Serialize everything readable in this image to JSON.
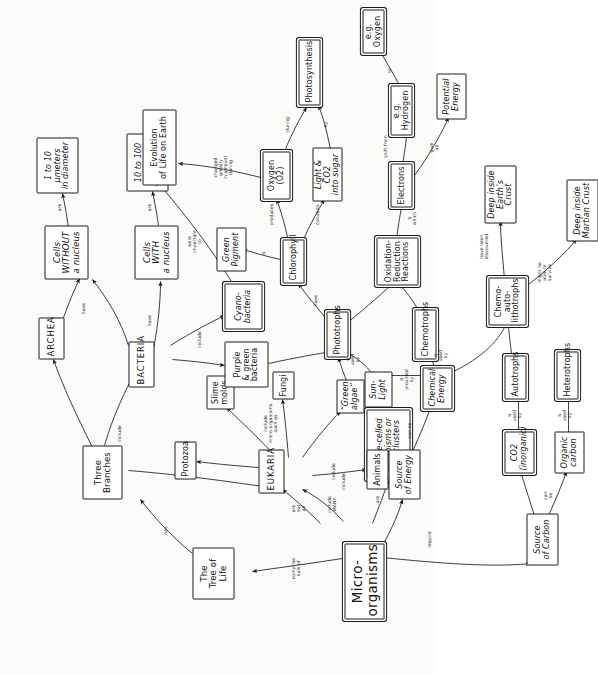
{
  "diagram": {
    "title": "Micro-organisms",
    "kind": "concept-map",
    "orientation": "rotated-90-ccw",
    "ink_color": "#1a1a1a",
    "paper_color": "#fbfbfa"
  },
  "nodes": {
    "micro_organisms": "Micro-organisms",
    "tree_of_life": "The\nTree of\nLife",
    "three_branches": "Three\nBranches",
    "archea": "ARCHEA",
    "bacteria": "BACTERIA",
    "eukaria": "EUKARIA",
    "cells_without_nucleus": "Cells\nWITHOUT\na nucleus",
    "cells_with_nucleus": "Cells\nWITH\na nucleus",
    "size_1_10": "1 to 10\nµmeters\nin diameter",
    "size_10_100": "10 to 100\nµmeters\nin diameter",
    "single_celled": "Single-celled\norganisms or\ncell clusters",
    "protozoa": "Protozoa",
    "slime_molds": "Slime\nmolds",
    "fungi": "Fungi",
    "green_algae": "“Green\nalgae”",
    "animals": "Animals",
    "purple_green_bacteria": "Purple\n& green\nbacteria",
    "cyanobacteria": "Cyano-\nbacteria",
    "green_pigment": "Green\nPigment",
    "chlorophyll": "Chlorophyll",
    "oxygen": "Oxygen\n(O2)",
    "light_co2_sugar": "Light & CO2\ninto sugar",
    "photosynthesis": "Photosynthesis",
    "evolution": "Evolution\nof Life on Earth",
    "source_of_energy": "Source\nof Energy",
    "source_of_carbon": "Source\nof Carbon",
    "sunlight": "Sun-\nLight",
    "chemical_energy": "Chemical\nEnergy",
    "co2_inorganic": "CO2\n(inorganic)",
    "organic_carbon": "Organic\ncarbon",
    "phototrophs": "Phototrophs",
    "chemotrophs": "Chemotrophs",
    "autotrophs": "Autotrophs",
    "heterotrophs": "Heterotrophs",
    "oxidation_reduction": "Oxidation-\nReduction\nReactions",
    "chemo_auto_lithotrophs": "Chemo-auto-\nlithotrophs",
    "electrons": "Electrons",
    "eg_hydrogen": "e.g. Hydrogen",
    "eg_oxygen": "e.g. Oxygen",
    "potential_energy": "Potential\nEnergy",
    "deep_earth_crust": "Deep inside\nEarth’s Crust",
    "deep_martian_crust": "Deep inside\nMartian Crust"
  },
  "link_labels": {
    "comprise_bulk_of": "comprise\nbulk of",
    "has": "has",
    "include_branches": "include",
    "have_archea": "have",
    "have_bacteria": "have",
    "are_without": "are",
    "are_with": "are",
    "are_not_all": "are\nnot\nall",
    "include_many": "include\nMANY",
    "are_single": "are",
    "include_eukaria": "include",
    "include_micro_such_as": "include\nmicro-organisms\nsuch as",
    "include_animals": "include",
    "include_bacteria_group": "include",
    "were_important_to": "were\nimportant\nto",
    "changed_greatly": "changed\ngreatly\nin amount\nduring",
    "is_green_pigment": "is",
    "produces": "produces",
    "converts": "converts",
    "have_chlorophyll": "have",
    "during": "during",
    "by": "by",
    "require": "require",
    "can_be_energy": "can be",
    "can_be_carbon": "can\nbe",
    "is_used_by_sunlight": "is\nused\nby",
    "is_provided_by": "is\nprovided\nby",
    "is_used_by_chemical": "is\nused\nby",
    "is_used_by_co2": "is\nused\nby",
    "is_used_by_organic": "is\nused\nby",
    "in_which": "is\nwhich",
    "shift_from": "shift from",
    "to": "to",
    "give_up": "give\nup",
    "have_been_discovered": "have been\ndiscovered",
    "might_be_able_to_survive": "might be\nable to\nsurvive"
  },
  "edges": [
    {
      "from": "micro_organisms",
      "to": "tree_of_life",
      "label": "comprise_bulk_of"
    },
    {
      "from": "tree_of_life",
      "to": "three_branches",
      "label": "has"
    },
    {
      "from": "three_branches",
      "to": "archea",
      "label": "include_branches"
    },
    {
      "from": "three_branches",
      "to": "bacteria",
      "label": "include_branches"
    },
    {
      "from": "three_branches",
      "to": "eukaria",
      "label": "include_branches"
    },
    {
      "from": "archea",
      "to": "cells_without_nucleus",
      "label": "have_archea"
    },
    {
      "from": "bacteria",
      "to": "cells_without_nucleus",
      "label": "have_bacteria"
    },
    {
      "from": "eukaria",
      "to": "cells_with_nucleus",
      "label": "have_bacteria"
    },
    {
      "from": "cells_without_nucleus",
      "to": "size_1_10",
      "label": "are_without"
    },
    {
      "from": "cells_with_nucleus",
      "to": "size_10_100",
      "label": "are_with"
    },
    {
      "from": "micro_organisms",
      "to": "eukaria",
      "label": "are_not_all"
    },
    {
      "from": "micro_organisms",
      "to": "single_celled",
      "label": "are_single"
    },
    {
      "from": "micro_organisms",
      "to": "eukaria",
      "label": "include_many"
    },
    {
      "from": "eukaria",
      "to": "protozoa",
      "label": "include_micro_such_as"
    },
    {
      "from": "eukaria",
      "to": "slime_molds",
      "label": "include_micro_such_as"
    },
    {
      "from": "eukaria",
      "to": "fungi",
      "label": "include_micro_such_as"
    },
    {
      "from": "eukaria",
      "to": "green_algae",
      "label": "include_micro_such_as"
    },
    {
      "from": "eukaria",
      "to": "animals",
      "label": "include_animals"
    },
    {
      "from": "bacteria",
      "to": "purple_green_bacteria",
      "label": "include_bacteria_group"
    },
    {
      "from": "bacteria",
      "to": "cyanobacteria",
      "label": "include_bacteria_group"
    },
    {
      "from": "cyanobacteria",
      "to": "evolution",
      "label": "were_important_to"
    },
    {
      "from": "oxygen",
      "to": "evolution",
      "label": "changed_greatly"
    },
    {
      "from": "purple_green_bacteria",
      "to": "phototrophs",
      "label": "are_single"
    },
    {
      "from": "green_algae",
      "to": "phototrophs",
      "label": "are_single"
    },
    {
      "from": "phototrophs",
      "to": "chlorophyll",
      "label": "have_chlorophyll"
    },
    {
      "from": "chlorophyll",
      "to": "green_pigment",
      "label": "is_green_pigment"
    },
    {
      "from": "chlorophyll",
      "to": "oxygen",
      "label": "produces"
    },
    {
      "from": "chlorophyll",
      "to": "light_co2_sugar",
      "label": "converts"
    },
    {
      "from": "oxygen",
      "to": "photosynthesis",
      "label": "during"
    },
    {
      "from": "light_co2_sugar",
      "to": "photosynthesis",
      "label": "by"
    },
    {
      "from": "micro_organisms",
      "to": "source_of_energy",
      "label": "require"
    },
    {
      "from": "micro_organisms",
      "to": "source_of_carbon",
      "label": "require"
    },
    {
      "from": "source_of_energy",
      "to": "sunlight",
      "label": "can_be_energy"
    },
    {
      "from": "source_of_energy",
      "to": "chemical_energy",
      "label": "can_be_energy"
    },
    {
      "from": "source_of_carbon",
      "to": "co2_inorganic",
      "label": "can_be_carbon"
    },
    {
      "from": "source_of_carbon",
      "to": "organic_carbon",
      "label": "can_be_carbon"
    },
    {
      "from": "sunlight",
      "to": "phototrophs",
      "label": "is_used_by_sunlight"
    },
    {
      "from": "sunlight",
      "to": "chemical_energy",
      "label": "is_provided_by"
    },
    {
      "from": "chemical_energy",
      "to": "chemotrophs",
      "label": "is_used_by_chemical"
    },
    {
      "from": "chemical_energy",
      "to": "chemo_auto_lithotrophs",
      "label": "is_used_by_chemical"
    },
    {
      "from": "co2_inorganic",
      "to": "autotrophs",
      "label": "is_used_by_co2"
    },
    {
      "from": "organic_carbon",
      "to": "heterotrophs",
      "label": "is_used_by_organic"
    },
    {
      "from": "phototrophs",
      "to": "oxidation_reduction",
      "label": ""
    },
    {
      "from": "chemotrophs",
      "to": "oxidation_reduction",
      "label": ""
    },
    {
      "from": "autotrophs",
      "to": "chemo_auto_lithotrophs",
      "label": ""
    },
    {
      "from": "oxidation_reduction",
      "to": "electrons",
      "label": "in_which"
    },
    {
      "from": "electrons",
      "to": "eg_hydrogen",
      "label": "shift_from"
    },
    {
      "from": "eg_hydrogen",
      "to": "eg_oxygen",
      "label": "to"
    },
    {
      "from": "electrons",
      "to": "potential_energy",
      "label": "give_up"
    },
    {
      "from": "chemo_auto_lithotrophs",
      "to": "deep_earth_crust",
      "label": "have_been_discovered"
    },
    {
      "from": "chemo_auto_lithotrophs",
      "to": "deep_martian_crust",
      "label": "might_be_able_to_survive"
    }
  ]
}
